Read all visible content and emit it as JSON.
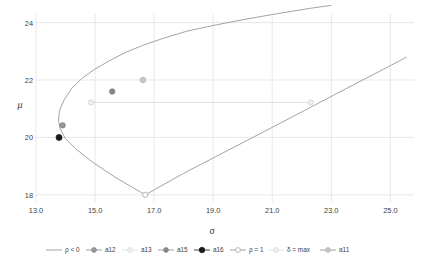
{
  "chart_data": {
    "type": "line",
    "title": "",
    "xlabel": "σ",
    "ylabel": "μ",
    "xlim": [
      13.0,
      25.8
    ],
    "ylim": [
      17.75,
      24.3
    ],
    "xticks": [
      "13.0",
      "15.0",
      "17.0",
      "19.0",
      "21.0",
      "23.0",
      "25.0"
    ],
    "xtick_values": [
      13.0,
      15.0,
      17.0,
      19.0,
      21.0,
      23.0,
      25.0
    ],
    "yticks": [
      "18",
      "20",
      "22",
      "24"
    ],
    "ytick_values": [
      18,
      20,
      22,
      24
    ],
    "grid": true,
    "legend_position": "bottom",
    "series": [
      {
        "name": "ρ < 0",
        "marker": "none",
        "color": "#8c8c8c",
        "points": [
          [
            16.7,
            18.0
          ],
          [
            15.7,
            18.6
          ],
          [
            14.9,
            19.15
          ],
          [
            14.35,
            19.6
          ],
          [
            14.0,
            19.95
          ],
          [
            13.82,
            20.3
          ],
          [
            13.76,
            20.6
          ],
          [
            13.8,
            20.95
          ],
          [
            13.95,
            21.3
          ],
          [
            14.2,
            21.7
          ],
          [
            14.55,
            22.05
          ],
          [
            14.95,
            22.35
          ],
          [
            15.45,
            22.65
          ],
          [
            16.0,
            22.95
          ],
          [
            16.6,
            23.2
          ],
          [
            17.3,
            23.45
          ],
          [
            18.1,
            23.7
          ],
          [
            19.0,
            23.9
          ],
          [
            20.0,
            24.1
          ],
          [
            21.1,
            24.3
          ],
          [
            22.3,
            24.5
          ],
          [
            23.0,
            24.6
          ]
        ]
      },
      {
        "name": "ρ = 1",
        "marker": "open-circle",
        "color": "#8c8c8c",
        "points": [
          [
            16.7,
            18.0
          ],
          [
            18.0,
            18.75
          ],
          [
            19.5,
            19.55
          ],
          [
            21.0,
            20.35
          ],
          [
            22.3,
            21.05
          ],
          [
            23.5,
            21.7
          ],
          [
            25.0,
            22.5
          ],
          [
            25.55,
            22.8
          ]
        ]
      },
      {
        "name": "δ = max",
        "marker": "light-circle",
        "color": "#d0d0d0",
        "points": [
          [
            14.86,
            21.22
          ],
          [
            22.3,
            21.22
          ]
        ]
      }
    ],
    "markers": [
      {
        "label": "a16",
        "x": 13.78,
        "y": 20.0,
        "style": "filled-black",
        "color": "#1a1a1a"
      },
      {
        "label": "a12",
        "x": 13.9,
        "y": 20.42,
        "style": "filled-gray",
        "color": "#9a9a9a"
      },
      {
        "label": "a13",
        "x": 14.86,
        "y": 21.22,
        "style": "light-circle",
        "color": "#e2e2e2"
      },
      {
        "label": "a15",
        "x": 15.58,
        "y": 21.6,
        "style": "filled-gray",
        "color": "#8a8a8a"
      },
      {
        "label": "a11",
        "x": 16.62,
        "y": 22.0,
        "style": "gray-circle",
        "color": "#bdbdbd"
      },
      {
        "label": "ρ = 1",
        "x": 16.7,
        "y": 18.0,
        "style": "open-circle",
        "color": "#ffffff"
      },
      {
        "label": "δ = max",
        "x": 22.3,
        "y": 21.22,
        "style": "light-circle",
        "color": "#ececec"
      }
    ]
  },
  "axes": {
    "x_title": "σ",
    "y_title": "μ",
    "x_tick_labels": [
      "13.0",
      "15.0",
      "17.0",
      "19.0",
      "21.0",
      "23.0",
      "25.0"
    ],
    "y_tick_labels": [
      "24",
      "22",
      "20",
      "18"
    ]
  },
  "legend": {
    "items": [
      {
        "label": "ρ < 0",
        "marker": "none",
        "color": "#8c8c8c"
      },
      {
        "label": "a12",
        "marker": "filled-gray",
        "color": "#9a9a9a"
      },
      {
        "label": "a13",
        "marker": "light-circle",
        "color": "#e2e2e2"
      },
      {
        "label": "a15",
        "marker": "filled-gray",
        "color": "#8a8a8a"
      },
      {
        "label": "a16",
        "marker": "filled-black",
        "color": "#1a1a1a"
      },
      {
        "label": "ρ = 1",
        "marker": "open-circle",
        "color": "#ffffff"
      },
      {
        "label": "δ = max",
        "marker": "light-circle",
        "color": "#ececec"
      },
      {
        "label": "a11",
        "marker": "gray-circle",
        "color": "#bdbdbd"
      }
    ]
  }
}
